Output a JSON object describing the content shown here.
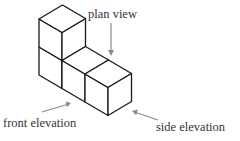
{
  "diagram": {
    "labels": {
      "plan_view": "plan view",
      "front_elevation": "front elevation",
      "side_elevation": "side elevation"
    },
    "cubes": {
      "count": 4,
      "arrangement": "two-cube column at back-left, plus two cubes extending forward along bottom row"
    },
    "colors": {
      "background": "#ffffff",
      "edges": "#1a1a1a",
      "arrows": "#8a8a8a",
      "text": "#333333"
    },
    "arrows": [
      {
        "name": "plan-view-arrow",
        "direction": "down",
        "points_to": "top faces"
      },
      {
        "name": "front-elevation-arrow",
        "direction": "up-right",
        "points_to": "front-left faces"
      },
      {
        "name": "side-elevation-arrow",
        "direction": "up-left",
        "points_to": "right face"
      }
    ]
  }
}
